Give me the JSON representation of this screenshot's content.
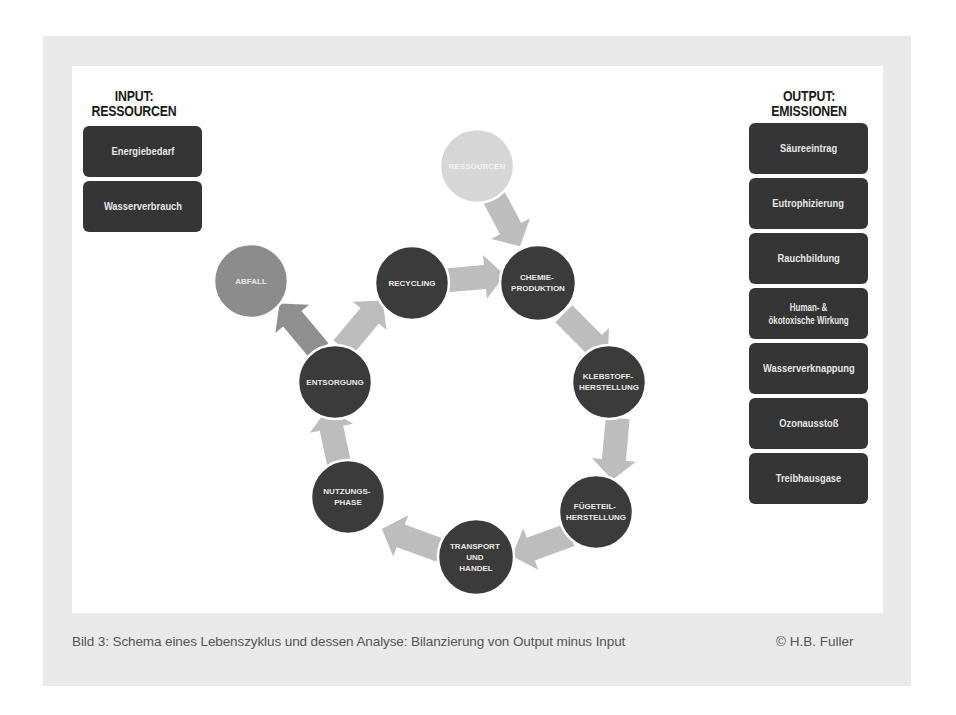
{
  "input": {
    "title_line1": "INPUT:",
    "title_line2": "RESSOURCEN",
    "items": [
      "Energiebedarf",
      "Wasserverbrauch"
    ]
  },
  "output": {
    "title_line1": "OUTPUT:",
    "title_line2": "EMISSIONEN",
    "items": [
      {
        "line1": "Säureeintrag",
        "line2": ""
      },
      {
        "line1": "Eutrophizierung",
        "line2": ""
      },
      {
        "line1": "Rauchbildung",
        "line2": ""
      },
      {
        "line1": "Human- &",
        "line2": "ökotoxische Wirkung"
      },
      {
        "line1": "Wasserverknappung",
        "line2": ""
      },
      {
        "line1": "Ozonausstoß",
        "line2": ""
      },
      {
        "line1": "Treibhausgase",
        "line2": ""
      }
    ]
  },
  "cycle": {
    "nodes": [
      {
        "id": "ressourcen",
        "lines": [
          "RESSOURCEN"
        ],
        "style": "light"
      },
      {
        "id": "chemie",
        "lines": [
          "CHEMIE-",
          "PRODUKTION"
        ],
        "style": "dark"
      },
      {
        "id": "klebstoff",
        "lines": [
          "KLEBSTOFF-",
          "HERSTELLUNG"
        ],
        "style": "dark"
      },
      {
        "id": "fuegeteil",
        "lines": [
          "FÜGETEIL-",
          "HERSTELLUNG"
        ],
        "style": "dark"
      },
      {
        "id": "transport",
        "lines": [
          "TRANSPORT",
          "UND",
          "HANDEL"
        ],
        "style": "dark"
      },
      {
        "id": "nutzung",
        "lines": [
          "NUTZUNGS-",
          "PHASE"
        ],
        "style": "dark"
      },
      {
        "id": "entsorgung",
        "lines": [
          "ENTSORGUNG"
        ],
        "style": "dark"
      },
      {
        "id": "recycling",
        "lines": [
          "RECYCLING"
        ],
        "style": "dark"
      },
      {
        "id": "abfall",
        "lines": [
          "ABFALL"
        ],
        "style": "medium"
      }
    ]
  },
  "colors": {
    "dark_node": "#3b3b3b",
    "medium_node": "#8c8c8c",
    "light_node": "#d6d6d6",
    "arrow": "#bdbdbd",
    "arrow_dark": "#8f8f8f",
    "box": "#353535",
    "frame": "#e9e9e9"
  },
  "caption": {
    "text": "Bild 3: Schema eines Lebenszyklus und dessen Analyse: Bilanzierung von Output minus Input",
    "credit": "© H.B. Fuller"
  }
}
